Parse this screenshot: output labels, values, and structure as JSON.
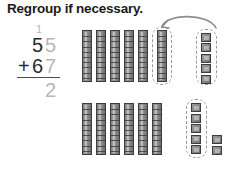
{
  "page": {
    "title": "Regroup if necessary."
  },
  "problem": {
    "type": "vertical-addition",
    "carry": "1",
    "addend1": "55",
    "addend1_tens": "5",
    "addend1_ones": "5",
    "operator": "+",
    "addend2": "67",
    "addend2_tens": "6",
    "addend2_ones": "7",
    "answer_partial": "2",
    "colors": {
      "dark": "#2b2b2b",
      "gray": "#b7b7b7",
      "rule": "#4a4a4a"
    }
  },
  "manipulatives": {
    "type": "base-ten-blocks",
    "rod_unit_value": 10,
    "cube_unit_value": 1,
    "rows": [
      {
        "name": "top-row",
        "represents": "55",
        "rods_loose": 5,
        "rods_boxed": 1,
        "cubes_boxed": 5,
        "cubes_loose": 0
      },
      {
        "name": "bottom-row",
        "represents": "67",
        "rods_loose": 6,
        "rods_boxed": 0,
        "cubes_boxed": 5,
        "cubes_loose": 2
      }
    ],
    "regroup_arrow": {
      "name": "regroup-arrow",
      "direction": "right-to-left",
      "meaning": "ten ones regrouped into one ten"
    },
    "colors": {
      "block_fill": "#8a8a8a",
      "block_stroke": "#3d3d3d",
      "dashed_outline": "#9a9a9a",
      "arrow": "#8d8d8d"
    }
  }
}
